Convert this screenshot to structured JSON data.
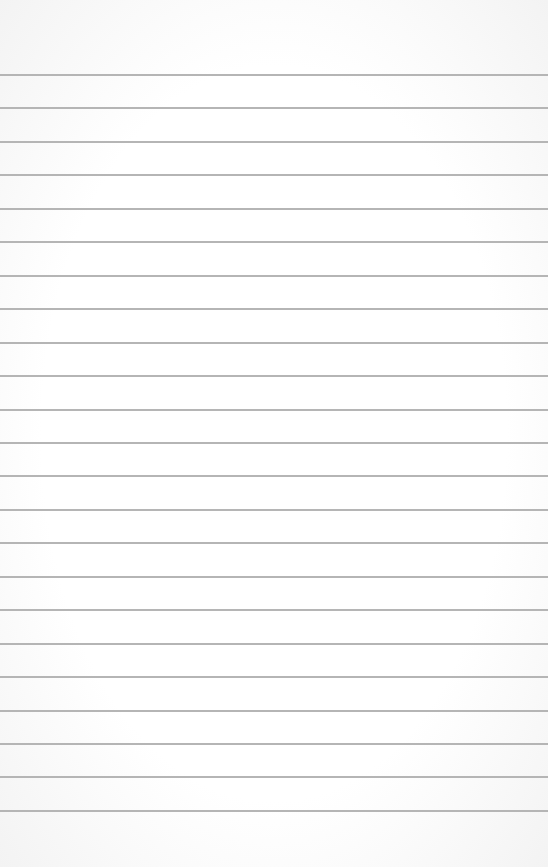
{
  "paper": {
    "background": "#ffffff",
    "line_color": "#b5b5b5",
    "first_line_y": 74,
    "line_spacing": 33.45,
    "line_count": 23
  }
}
